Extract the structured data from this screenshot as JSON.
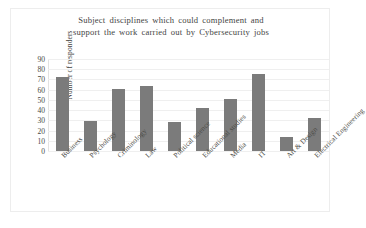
{
  "chart_data": {
    "type": "bar",
    "title": "Subject disciplines which could complement and support the work carried out by Cybersecurity jobs",
    "title_line1": "Subject disciplines which could complement and",
    "title_line2": "support the work carried out by Cybersecurity  jobs",
    "xlabel": "",
    "ylabel": "Number of responders",
    "ylim": [
      0,
      90
    ],
    "yticks": [
      0,
      10,
      20,
      30,
      40,
      50,
      60,
      70,
      80,
      90
    ],
    "grid": true,
    "legend": false,
    "bar_color": "#7b7b7b",
    "categories": [
      "Business",
      "Psychology",
      "Criminology",
      "Law",
      "Political science",
      "Educational studies",
      "Media",
      "IT",
      "Art & Design",
      "Electrical Engineering"
    ],
    "values": [
      72,
      29,
      61,
      64,
      28,
      42,
      51,
      75,
      14,
      32
    ]
  }
}
